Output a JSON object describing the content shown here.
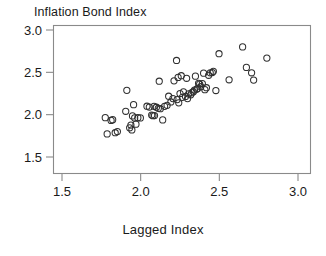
{
  "chart_data": {
    "type": "scatter",
    "title": "Inflation Bond Index",
    "xlabel": "Lagged Index",
    "ylabel": "",
    "xlim": [
      1.4,
      3.05
    ],
    "ylim": [
      1.44,
      3.06
    ],
    "xticks": [
      "1.5",
      "2.0",
      "2.5",
      "3.0"
    ],
    "xtick_values": [
      1.5,
      2.0,
      2.5,
      3.0
    ],
    "yticks": [
      "1.5",
      "2.0",
      "2.5",
      "3.0"
    ],
    "ytick_values": [
      1.5,
      2.0,
      2.5,
      3.0
    ],
    "grid": false,
    "legend": "none",
    "marker": "open-circle",
    "marker_color": "#303030",
    "n_points": 72,
    "points": [
      [
        1.775,
        1.965
      ],
      [
        1.787,
        1.773
      ],
      [
        1.812,
        1.932
      ],
      [
        1.822,
        1.941
      ],
      [
        1.838,
        1.787
      ],
      [
        1.852,
        1.8
      ],
      [
        1.905,
        2.04
      ],
      [
        1.912,
        2.287
      ],
      [
        1.93,
        1.845
      ],
      [
        1.938,
        1.877
      ],
      [
        1.944,
        1.82
      ],
      [
        1.948,
        1.985
      ],
      [
        1.955,
        2.118
      ],
      [
        1.962,
        1.962
      ],
      [
        1.97,
        1.888
      ],
      [
        1.982,
        1.965
      ],
      [
        1.998,
        1.962
      ],
      [
        2.04,
        2.1
      ],
      [
        2.055,
        2.09
      ],
      [
        2.07,
        1.995
      ],
      [
        2.078,
        1.988
      ],
      [
        2.085,
        2.098
      ],
      [
        2.088,
        1.99
      ],
      [
        2.1,
        2.088
      ],
      [
        2.112,
        2.075
      ],
      [
        2.118,
        2.395
      ],
      [
        2.125,
        2.07
      ],
      [
        2.14,
        1.938
      ],
      [
        2.152,
        2.098
      ],
      [
        2.168,
        2.11
      ],
      [
        2.178,
        2.218
      ],
      [
        2.192,
        2.15
      ],
      [
        2.205,
        2.19
      ],
      [
        2.212,
        2.4
      ],
      [
        2.228,
        2.64
      ],
      [
        2.232,
        2.178
      ],
      [
        2.238,
        2.44
      ],
      [
        2.242,
        2.14
      ],
      [
        2.25,
        2.25
      ],
      [
        2.258,
        2.46
      ],
      [
        2.265,
        2.205
      ],
      [
        2.272,
        2.27
      ],
      [
        2.285,
        2.215
      ],
      [
        2.292,
        2.43
      ],
      [
        2.298,
        2.19
      ],
      [
        2.305,
        2.245
      ],
      [
        2.318,
        2.235
      ],
      [
        2.325,
        2.26
      ],
      [
        2.335,
        2.272
      ],
      [
        2.342,
        2.29
      ],
      [
        2.348,
        2.455
      ],
      [
        2.355,
        2.3
      ],
      [
        2.362,
        2.31
      ],
      [
        2.368,
        2.37
      ],
      [
        2.375,
        2.362
      ],
      [
        2.382,
        2.33
      ],
      [
        2.392,
        2.368
      ],
      [
        2.4,
        2.49
      ],
      [
        2.408,
        2.295
      ],
      [
        2.418,
        2.318
      ],
      [
        2.432,
        2.465
      ],
      [
        2.442,
        2.495
      ],
      [
        2.455,
        2.498
      ],
      [
        2.462,
        2.512
      ],
      [
        2.478,
        2.285
      ],
      [
        2.498,
        2.72
      ],
      [
        2.562,
        2.412
      ],
      [
        2.648,
        2.8
      ],
      [
        2.672,
        2.558
      ],
      [
        2.705,
        2.495
      ],
      [
        2.718,
        2.408
      ],
      [
        2.802,
        2.668
      ]
    ]
  }
}
